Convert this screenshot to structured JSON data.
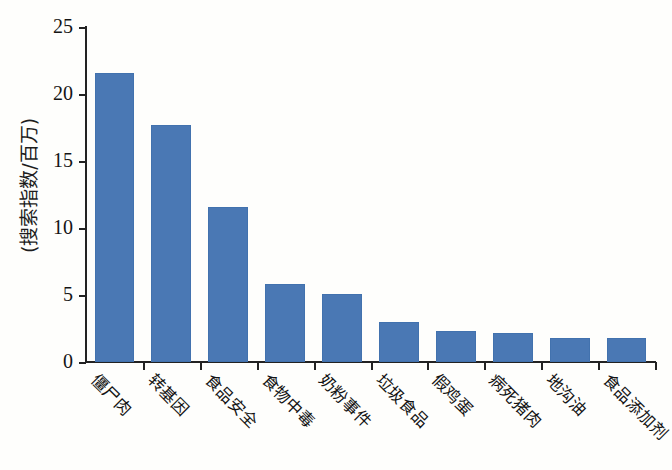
{
  "chart_data": {
    "type": "bar",
    "title": "",
    "xlabel": "",
    "ylabel": "(搜索指数/百万)",
    "ylim": [
      0,
      25
    ],
    "yticks": [
      0,
      5,
      10,
      15,
      20,
      25
    ],
    "grid": false,
    "legend": false,
    "bar_color": "#4a78b4",
    "categories": [
      "僵尸肉",
      "转基因",
      "食品安全",
      "食物中毒",
      "奶粉事件",
      "垃圾食品",
      "假鸡蛋",
      "病死猪肉",
      "地沟油",
      "食品添加剂"
    ],
    "values": [
      21.6,
      17.7,
      11.6,
      5.8,
      5.1,
      3.0,
      2.3,
      2.2,
      1.8,
      1.8
    ]
  }
}
